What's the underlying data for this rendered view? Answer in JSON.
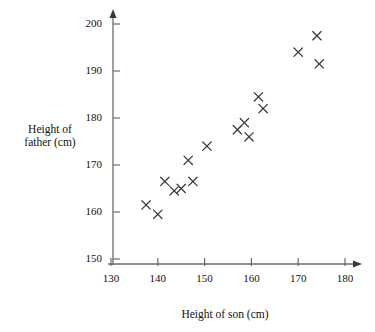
{
  "chart_data": {
    "type": "scatter",
    "title": "",
    "xlabel": "Height of son (cm)",
    "ylabel": "Height of father (cm)",
    "xlim": [
      130,
      180
    ],
    "ylim": [
      150,
      200
    ],
    "xticks": [
      130,
      140,
      150,
      160,
      170,
      180
    ],
    "yticks": [
      150,
      160,
      170,
      180,
      190,
      200
    ],
    "grid": false,
    "legend": null,
    "marker": "x",
    "marker_color": "#3a3a3a",
    "axis_color": "#6b6b6b",
    "points": [
      {
        "x": 137.5,
        "y": 161.5
      },
      {
        "x": 140.0,
        "y": 159.5
      },
      {
        "x": 141.5,
        "y": 166.5
      },
      {
        "x": 143.5,
        "y": 164.5
      },
      {
        "x": 145.0,
        "y": 165.0
      },
      {
        "x": 146.5,
        "y": 171.0
      },
      {
        "x": 147.5,
        "y": 166.5
      },
      {
        "x": 150.5,
        "y": 174.0
      },
      {
        "x": 157.0,
        "y": 177.5
      },
      {
        "x": 158.5,
        "y": 179.0
      },
      {
        "x": 159.5,
        "y": 176.0
      },
      {
        "x": 161.5,
        "y": 184.5
      },
      {
        "x": 162.5,
        "y": 182.0
      },
      {
        "x": 170.0,
        "y": 194.0
      },
      {
        "x": 174.0,
        "y": 197.5
      },
      {
        "x": 174.5,
        "y": 191.5
      }
    ]
  },
  "ylabel_lines": "Height of\nfather (cm)"
}
